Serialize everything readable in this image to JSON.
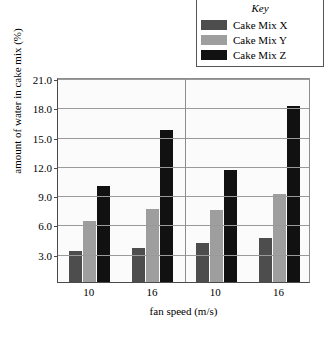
{
  "legend": {
    "title": "Key",
    "items": [
      {
        "label": "Cake Mix X",
        "color": "#4d4d4d"
      },
      {
        "label": "Cake Mix Y",
        "color": "#9e9e9e"
      },
      {
        "label": "Cake Mix Z",
        "color": "#111111"
      }
    ]
  },
  "chart_data": {
    "type": "bar",
    "title": "",
    "xlabel": "fan speed (m/s)",
    "ylabel": "amount of water in cake mix (%)",
    "categories": [
      "10",
      "16",
      "10",
      "16"
    ],
    "series": [
      {
        "name": "Cake Mix X",
        "color": "#4d4d4d",
        "values": [
          3.2,
          3.5,
          4.0,
          4.5
        ]
      },
      {
        "name": "Cake Mix Y",
        "color": "#9e9e9e",
        "values": [
          6.2,
          7.5,
          7.4,
          9.0
        ]
      },
      {
        "name": "Cake Mix Z",
        "color": "#111111",
        "values": [
          9.8,
          15.6,
          11.5,
          18.0
        ]
      }
    ],
    "ylim": [
      0,
      21
    ],
    "ytick_labels": [
      "3.0",
      "6.0",
      "9.0",
      "12.0",
      "15.0",
      "18.0",
      "21.0"
    ],
    "ytick_values": [
      3,
      6,
      9,
      12,
      15,
      18,
      21
    ],
    "grid": true,
    "legend_position": "top-right",
    "group_divider_after": 2
  },
  "caption": ""
}
